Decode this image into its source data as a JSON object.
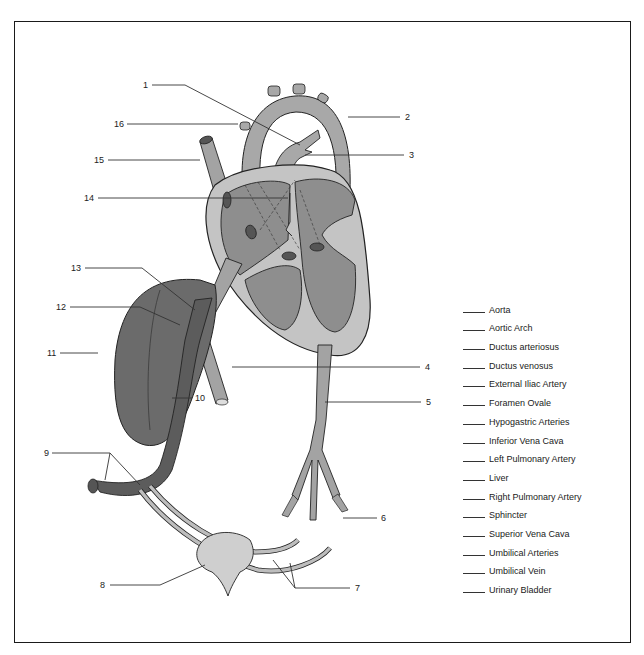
{
  "figure": {
    "type": "fetal circulation anatomy diagram (labeling exercise)",
    "colors": {
      "frame": "#1a1a1a",
      "heart_outer": "#c4c4c4",
      "heart_chamber": "#8e8e8e",
      "vessel": "#a3a3a3",
      "liver": "#6b6b6b",
      "umbilical_vein": "#5c5c5c",
      "bladder": "#cfcfcf"
    },
    "callouts": [
      {
        "num": "1",
        "x": 143,
        "y": 85
      },
      {
        "num": "2",
        "x": 406,
        "y": 118
      },
      {
        "num": "3",
        "x": 410,
        "y": 156
      },
      {
        "num": "4",
        "x": 427,
        "y": 368
      },
      {
        "num": "5",
        "x": 428,
        "y": 403
      },
      {
        "num": "6",
        "x": 383,
        "y": 519
      },
      {
        "num": "7",
        "x": 357,
        "y": 590
      },
      {
        "num": "8",
        "x": 100,
        "y": 586
      },
      {
        "num": "9",
        "x": 44,
        "y": 455
      },
      {
        "num": "10",
        "x": 198,
        "y": 401
      },
      {
        "num": "11",
        "x": 48,
        "y": 356
      },
      {
        "num": "12",
        "x": 58,
        "y": 311
      },
      {
        "num": "13",
        "x": 72,
        "y": 272
      },
      {
        "num": "14",
        "x": 83,
        "y": 201
      },
      {
        "num": "15",
        "x": 92,
        "y": 163
      },
      {
        "num": "16",
        "x": 114,
        "y": 127
      }
    ]
  },
  "answer_key": {
    "items": [
      "Aorta",
      "Aortic Arch",
      "Ductus arteriosus",
      "Ductus  venosus",
      "External Iliac Artery",
      "Foramen Ovale",
      "Hypogastric Arteries",
      "Inferior Vena Cava",
      "Left Pulmonary Artery",
      "Liver",
      "Right Pulmonary Artery",
      "Sphincter",
      "Superior Vena Cava",
      "Umbilical Arteries",
      "Umbilical Vein",
      "Urinary Bladder"
    ]
  }
}
